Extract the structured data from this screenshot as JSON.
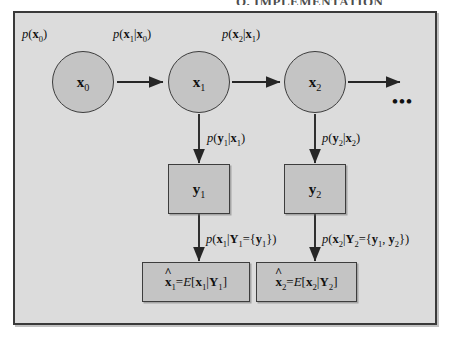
{
  "figure": {
    "kind": "bayesian-state-space-graphical-model",
    "top_cropped_text": "Q. IMPLEMENTATION",
    "frame": {
      "border_color": "#3a3a3a",
      "fill_color": "#dcdcdc"
    },
    "node_fill_color": "#c4c4c4",
    "node_border_color": "#3d3d3d",
    "ellipsis": "•••"
  },
  "state_nodes": [
    {
      "id": "x0",
      "base": "x",
      "index": "0"
    },
    {
      "id": "x1",
      "base": "x",
      "index": "1"
    },
    {
      "id": "x2",
      "base": "x",
      "index": "2"
    }
  ],
  "observation_nodes": [
    {
      "id": "y1",
      "base": "y",
      "index": "1"
    },
    {
      "id": "y2",
      "base": "y",
      "index": "2"
    }
  ],
  "estimate_nodes": [
    {
      "id": "xhat1",
      "text": "x̂1=E[x1|Y1]"
    },
    {
      "id": "xhat2",
      "text": "x̂2=E[x2|Y2]"
    }
  ],
  "labels": {
    "prior": "p(x0)",
    "transition_1": "p(x1|x0)",
    "transition_2": "p(x2|x1)",
    "emission_1": "p(y1|x1)",
    "emission_2": "p(y2|x2)",
    "posterior_1": "p(x1|Y1={y1})",
    "posterior_2": "p(x2|Y2={y1, y2})"
  }
}
